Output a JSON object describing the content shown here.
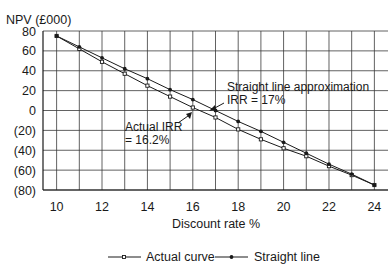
{
  "chart_data": {
    "type": "line",
    "title": "",
    "ylabel": "NPV (£000)",
    "xlabel": "Discount rate %",
    "xlim": [
      9.4,
      24.6
    ],
    "ylim": [
      -80,
      80
    ],
    "x_ticks": [
      10,
      12,
      14,
      16,
      18,
      20,
      22,
      24
    ],
    "y_ticks": [
      80,
      60,
      40,
      20,
      0,
      -20,
      -40,
      -60,
      -80
    ],
    "y_tick_labels": [
      "80",
      "60",
      "40",
      "20",
      "0",
      "(20)",
      "(40)",
      "(60)",
      "(80)"
    ],
    "grid": true,
    "x": [
      10,
      11,
      12,
      13,
      14,
      15,
      16,
      17,
      18,
      19,
      20,
      21,
      22,
      23,
      24
    ],
    "series": [
      {
        "name": "Actual curve",
        "marker": "open-square",
        "values": [
          75,
          62,
          49,
          37,
          25,
          14,
          3,
          -7,
          -19,
          -29,
          -38,
          -46,
          -56,
          -65,
          -75
        ]
      },
      {
        "name": "Straight line",
        "marker": "filled-dot",
        "values": [
          75,
          64,
          53,
          42,
          32,
          21,
          11,
          0,
          -11,
          -21,
          -32,
          -43,
          -54,
          -64,
          -75
        ]
      }
    ],
    "annotations": [
      {
        "text_lines": [
          "Straight line approximation",
          "IRR = 17%"
        ],
        "point": [
          17,
          0
        ]
      },
      {
        "text_lines": [
          "Actual IRR",
          "= 16.2%"
        ],
        "point": [
          16.2,
          0
        ]
      }
    ],
    "legend": {
      "position": "bottom-center",
      "entries": [
        "Actual curve",
        "Straight line"
      ]
    }
  },
  "labels": {
    "ylabel": "NPV (£000)",
    "xlabel": "Discount rate %",
    "annotation_straight_1": "Straight line approximation",
    "annotation_straight_2": "IRR = 17%",
    "annotation_actual_1": "Actual IRR",
    "annotation_actual_2": "= 16.2%",
    "legend_actual": "Actual curve",
    "legend_straight": "Straight line"
  },
  "colors": {
    "line": "#1a1a1a",
    "grid": "#3a3a3a",
    "background": "#ffffff"
  }
}
